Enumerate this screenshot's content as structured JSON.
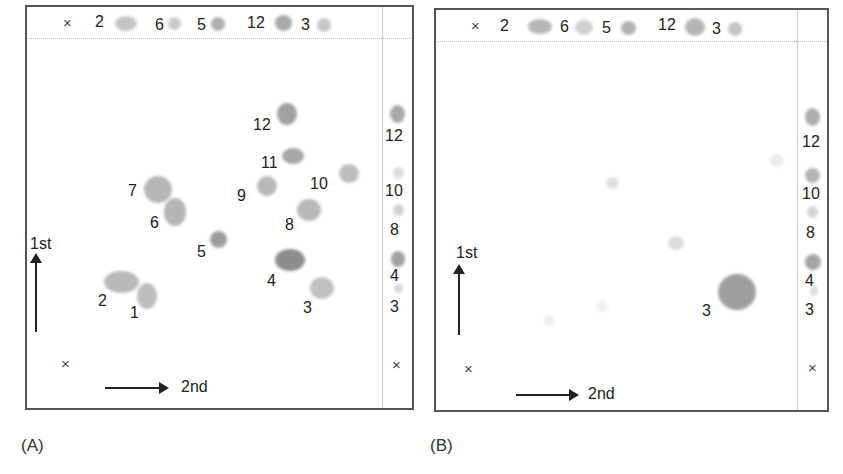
{
  "panels": [
    {
      "id": "A",
      "caption": "(A)",
      "origin_mark": "×",
      "axis_first": "1st",
      "axis_second": "2nd",
      "top_strip": {
        "mark": "×",
        "labels": [
          "2",
          "6",
          "5",
          "12",
          "3"
        ]
      },
      "side_strip": {
        "labels": [
          "12",
          "10",
          "8",
          "4",
          "3"
        ],
        "mark": "×"
      },
      "spots": [
        {
          "id": "1",
          "label": "1"
        },
        {
          "id": "2",
          "label": "2"
        },
        {
          "id": "3",
          "label": "3"
        },
        {
          "id": "4",
          "label": "4"
        },
        {
          "id": "5",
          "label": "5"
        },
        {
          "id": "6",
          "label": "6"
        },
        {
          "id": "7",
          "label": "7"
        },
        {
          "id": "8",
          "label": "8"
        },
        {
          "id": "9",
          "label": "9"
        },
        {
          "id": "10",
          "label": "10"
        },
        {
          "id": "11",
          "label": "11"
        },
        {
          "id": "12",
          "label": "12"
        }
      ]
    },
    {
      "id": "B",
      "caption": "(B)",
      "origin_mark": "×",
      "axis_first": "1st",
      "axis_second": "2nd",
      "top_strip": {
        "mark": "×",
        "labels": [
          "2",
          "6",
          "5",
          "12",
          "3"
        ]
      },
      "side_strip": {
        "labels": [
          "12",
          "10",
          "8",
          "4",
          "3"
        ],
        "mark": "×"
      },
      "spots": [
        {
          "id": "3",
          "label": "3"
        }
      ]
    }
  ],
  "colors": {
    "border": "#555555",
    "spot_dark": "#8a8a8a",
    "spot_mid": "#a8a8a8",
    "spot_light": "#c8c8c8",
    "spot_faint": "#e2e2e2"
  }
}
